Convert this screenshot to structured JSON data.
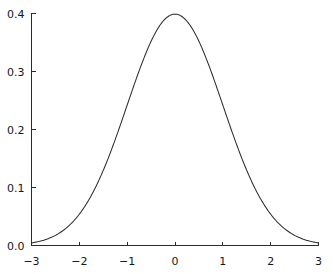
{
  "chart_data": {
    "type": "line",
    "title": "",
    "subtitle": "",
    "xlabel": "",
    "ylabel": "",
    "xlim": [
      -3,
      3
    ],
    "ylim": [
      0.0,
      0.4
    ],
    "grid": false,
    "legend": null,
    "legend_position": "none",
    "annotations": [],
    "xticks": [
      -3,
      -2,
      -1,
      0,
      1,
      2,
      3
    ],
    "xtick_labels": [
      "−3",
      "−2",
      "−1",
      "0",
      "1",
      "2",
      "3"
    ],
    "yticks": [
      0.0,
      0.1,
      0.2,
      0.3,
      0.4
    ],
    "ytick_labels": [
      "0.0",
      "0.1",
      "0.2",
      "0.3",
      "0.4"
    ],
    "series": [
      {
        "name": "standard normal pdf",
        "color": "#2e2e2e",
        "x": [
          -3.0,
          -2.9,
          -2.8,
          -2.7,
          -2.6,
          -2.5,
          -2.4,
          -2.3,
          -2.2,
          -2.1,
          -2.0,
          -1.9,
          -1.8,
          -1.7,
          -1.6,
          -1.5,
          -1.4,
          -1.3,
          -1.2,
          -1.1,
          -1.0,
          -0.9,
          -0.8,
          -0.7,
          -0.6,
          -0.5,
          -0.4,
          -0.3,
          -0.2,
          -0.1,
          0.0,
          0.1,
          0.2,
          0.3,
          0.4,
          0.5,
          0.6,
          0.7,
          0.8,
          0.9,
          1.0,
          1.1,
          1.2,
          1.3,
          1.4,
          1.5,
          1.6,
          1.7,
          1.8,
          1.9,
          2.0,
          2.1,
          2.2,
          2.3,
          2.4,
          2.5,
          2.6,
          2.7,
          2.8,
          2.9,
          3.0
        ],
        "values": [
          0.0044,
          0.006,
          0.0079,
          0.0104,
          0.0136,
          0.0175,
          0.0224,
          0.0283,
          0.0355,
          0.044,
          0.054,
          0.0656,
          0.079,
          0.094,
          0.1109,
          0.1295,
          0.1497,
          0.1714,
          0.1942,
          0.2179,
          0.242,
          0.2661,
          0.2897,
          0.3123,
          0.3332,
          0.3521,
          0.3683,
          0.3814,
          0.391,
          0.397,
          0.3989,
          0.397,
          0.391,
          0.3814,
          0.3683,
          0.3521,
          0.3332,
          0.3123,
          0.2897,
          0.2661,
          0.242,
          0.2179,
          0.1942,
          0.1714,
          0.1497,
          0.1295,
          0.1109,
          0.094,
          0.079,
          0.0656,
          0.054,
          0.044,
          0.0355,
          0.0283,
          0.0224,
          0.0175,
          0.0136,
          0.0104,
          0.0079,
          0.006,
          0.0044
        ]
      }
    ],
    "peak": {
      "x": 0.0,
      "y": 0.3989
    }
  },
  "colors": {
    "background": "#ffffff",
    "axis": "#2b2b2b",
    "curve": "#2e2e2e",
    "text": "#161616"
  }
}
